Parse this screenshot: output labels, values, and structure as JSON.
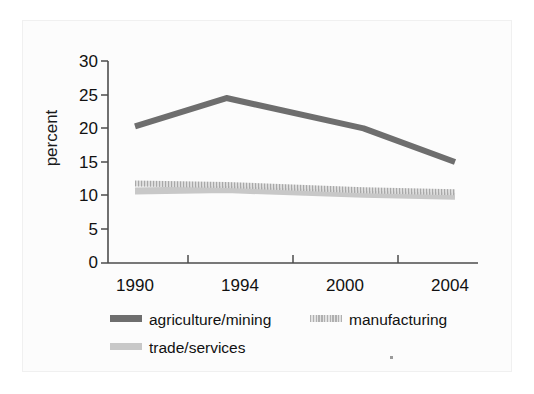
{
  "chart_data": {
    "type": "line",
    "title": "",
    "subtitle": "",
    "xlabel": "",
    "ylabel": "percent",
    "categories": [
      "1990",
      "1994",
      "2000",
      "2004"
    ],
    "x": [
      1990,
      1994,
      2000,
      2004
    ],
    "xtick_labels": [
      "1990",
      "1994",
      "2000",
      "2004"
    ],
    "ytick_labels": [
      "0",
      "5",
      "10",
      "15",
      "20",
      "25",
      "30"
    ],
    "yticks": [
      0,
      5,
      10,
      15,
      20,
      25,
      30
    ],
    "ylim": [
      0,
      30
    ],
    "grid": false,
    "legend_position": "below-left",
    "series": [
      {
        "name": "agriculture/mining",
        "color": "#6e6e6e",
        "style": "solid",
        "values": [
          20.3,
          24.5,
          20.0,
          15.0
        ]
      },
      {
        "name": "manufacturing",
        "color": "#b5b5b5",
        "style": "dotted",
        "values": [
          11.8,
          11.6,
          10.8,
          10.5
        ]
      },
      {
        "name": "trade/services",
        "color": "#c8c8c8",
        "style": "solid",
        "values": [
          10.7,
          10.9,
          10.2,
          9.9
        ]
      }
    ]
  },
  "legend": {
    "items": [
      {
        "label": "agriculture/mining",
        "color": "#6e6e6e",
        "pattern": "solid"
      },
      {
        "label": "manufacturing",
        "color": "#b5b5b5",
        "pattern": "dotted"
      },
      {
        "label": "trade/services",
        "color": "#c8c8c8",
        "pattern": "solid"
      }
    ]
  },
  "axes": {
    "y_title": "percent",
    "y_labels": [
      "30",
      "25",
      "20",
      "15",
      "10",
      "5",
      "0"
    ],
    "x_labels": [
      "1990",
      "1994",
      "2000",
      "2004"
    ]
  },
  "colors": {
    "axis": "#4d4d4d",
    "text": "#111111",
    "background": "#ffffff",
    "frame": "#f0f0f0"
  }
}
